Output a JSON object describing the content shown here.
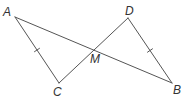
{
  "diagram": {
    "type": "geometry",
    "stroke_color": "#555555",
    "label_color": "#333333",
    "points": {
      "A": {
        "label": "A",
        "x": 15,
        "y": 17,
        "lx": 3,
        "ly": 16
      },
      "B": {
        "label": "B",
        "x": 172,
        "y": 83,
        "lx": 173,
        "ly": 94
      },
      "C": {
        "label": "C",
        "x": 59,
        "y": 83,
        "lx": 53,
        "ly": 96
      },
      "D": {
        "label": "D",
        "x": 128,
        "y": 18,
        "lx": 125,
        "ly": 15
      },
      "M": {
        "label": "M",
        "x": 93,
        "y": 50,
        "lx": 90,
        "ly": 63
      }
    },
    "segments": [
      {
        "from": "A",
        "to": "B"
      },
      {
        "from": "C",
        "to": "D"
      },
      {
        "from": "A",
        "to": "C",
        "tick_marks": 1
      },
      {
        "from": "D",
        "to": "B",
        "tick_marks": 1
      }
    ]
  }
}
